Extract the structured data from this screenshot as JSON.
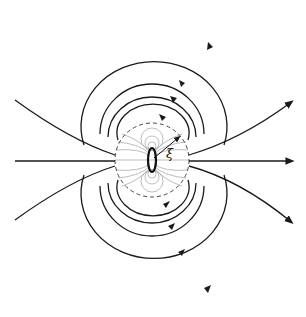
{
  "diagram": {
    "title": "",
    "colors": {
      "line": "#1a1a1a",
      "faint": "#9a9a9a",
      "background": "#ffffff"
    },
    "labels": {
      "xi": "ξ"
    },
    "center": [
      152,
      160
    ],
    "near_field_radius": 37,
    "loop_ellipse": {
      "rx": 4,
      "ry": 12
    },
    "upper_loops_top_y": [
      16,
      73,
      98,
      117
    ],
    "lower_loops_bottom_y": [
      307,
      250,
      225,
      206
    ],
    "open_lines_right_ends": [
      [
        292,
        102
      ],
      [
        292,
        162
      ],
      [
        292,
        222
      ]
    ],
    "open_lines_left_ends": [
      [
        15,
        100
      ],
      [
        15,
        161
      ],
      [
        15,
        220
      ]
    ]
  }
}
